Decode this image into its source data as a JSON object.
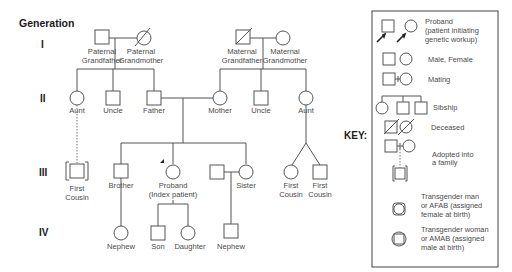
{
  "diagram": {
    "title": "Generation",
    "key_title": "KEY:",
    "generations": [
      "I",
      "II",
      "III",
      "IV"
    ],
    "people": {
      "paternal_grandfather": [
        "Paternal",
        "Grandfather"
      ],
      "paternal_grandmother": [
        "Paternal",
        "Grandmother"
      ],
      "maternal_grandfather": [
        "Maternal",
        "Grandfather"
      ],
      "maternal_grandmother": [
        "Maternal",
        "Grandmother"
      ],
      "aunt_paternal": "Aunt",
      "uncle_paternal": "Uncle",
      "father": "Father",
      "mother": "Mother",
      "uncle_maternal": "Uncle",
      "aunt_maternal": "Aunt",
      "first_cousin_adopted": [
        "First",
        "Cousin"
      ],
      "brother": "Brother",
      "proband": [
        "Proband",
        "(Index patient)"
      ],
      "sister": "Sister",
      "first_cousin_1": [
        "First",
        "Cousin"
      ],
      "first_cousin_2": [
        "First",
        "Cousin"
      ],
      "nephew_1": "Nephew",
      "son": "Son",
      "daughter": "Daughter",
      "nephew_2": "Nephew"
    },
    "legend": [
      {
        "symbol": "proband",
        "text": [
          "Proband",
          "(patient initiating",
          "genetic workup)"
        ]
      },
      {
        "symbol": "male-female",
        "text": [
          "Male, Female"
        ]
      },
      {
        "symbol": "mating",
        "text": [
          "Mating"
        ]
      },
      {
        "symbol": "sibship",
        "text": [
          "Sibship"
        ]
      },
      {
        "symbol": "deceased",
        "text": [
          "Deceased"
        ]
      },
      {
        "symbol": "adopted",
        "text": [
          "Adopted into",
          "a family"
        ]
      },
      {
        "symbol": "transgender-man",
        "text": [
          "Transgender man",
          "or AFAB (assigned",
          "female at birth)"
        ]
      },
      {
        "symbol": "transgender-woman",
        "text": [
          "Transgender woman",
          "or AMAB (assigned",
          "male at birth)"
        ]
      }
    ]
  }
}
